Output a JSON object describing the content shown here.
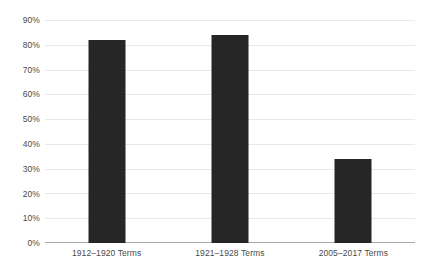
{
  "chart_data": {
    "type": "bar",
    "title": "",
    "subtitle": "",
    "xlabel": "",
    "ylabel": "",
    "categories": [
      "1912–1920 Terms",
      "1921–1928 Terms",
      "2005–2017 Terms"
    ],
    "values": [
      82,
      84,
      34
    ],
    "ylim": [
      0,
      90
    ],
    "ytick_labels": [
      "0%",
      "10%",
      "20%",
      "30%",
      "40%",
      "50%",
      "60%",
      "70%",
      "80%",
      "90%"
    ],
    "ytick_values": [
      0,
      10,
      20,
      30,
      40,
      50,
      60,
      70,
      80,
      90
    ],
    "grid": true,
    "legend": false,
    "legend_position": "none",
    "bar_color": "#262626",
    "gridline_color": "#e8e8ea",
    "axis_color": "#a9a9ad",
    "text_color": "#4a4a4a",
    "background_color": "#ffffff"
  }
}
